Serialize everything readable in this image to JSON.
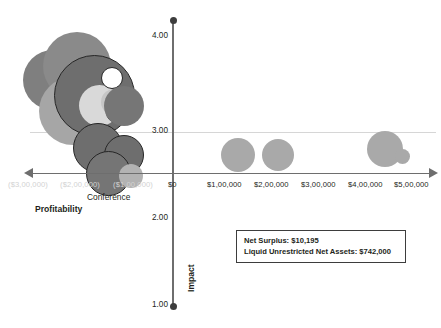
{
  "chart_data": {
    "type": "scatter",
    "title": "",
    "xlabel": "Profitability",
    "ylabel": "Impact",
    "xlim": [
      -350000,
      550000
    ],
    "ylim": [
      1.0,
      4.3
    ],
    "grid": true,
    "legend_position": "none",
    "x_tick_labels": [
      "($3,00,000)",
      "($2,00,000)",
      "($1,00,000)",
      "$0",
      "$1,00,000",
      "$2,00,000",
      "$3,00,000",
      "$4,00,000",
      "$5,00,000"
    ],
    "x_tick_values": [
      -300000,
      -200000,
      -100000,
      0,
      100000,
      200000,
      300000,
      400000,
      500000
    ],
    "y_tick_labels": [
      "4.00",
      "3.00",
      "2.00",
      "1.00"
    ],
    "y_tick_values": [
      4.0,
      3.0,
      2.0,
      1.0
    ],
    "annotations": [
      {
        "text": "Conference",
        "x": -215000,
        "y": 1.82
      },
      {
        "text": "Profitability",
        "x": -295000,
        "y": 1.68
      }
    ],
    "series": [
      {
        "name": "Programs",
        "points": [
          {
            "x": -258000,
            "y": 3.6,
            "size": 60,
            "color": "#7f7f7f",
            "outline": "none"
          },
          {
            "x": -205000,
            "y": 3.76,
            "size": 68,
            "color": "#8a8a8a",
            "outline": "none"
          },
          {
            "x": -214000,
            "y": 3.24,
            "size": 68,
            "color": "#a6a6a6",
            "outline": "none"
          },
          {
            "x": -168000,
            "y": 3.42,
            "size": 81,
            "color": "#6e6e6e",
            "outline": "#262626"
          },
          {
            "x": -158000,
            "y": 3.3,
            "size": 41,
            "color": "#d9d9d9",
            "outline": "none"
          },
          {
            "x": -130000,
            "y": 3.62,
            "size": 22,
            "color": "#ffffff",
            "outline": "#262626"
          },
          {
            "x": -126000,
            "y": 3.34,
            "size": 26,
            "color": "#c6c6c6",
            "outline": "none"
          },
          {
            "x": -120000,
            "y": 3.22,
            "size": 21,
            "color": "#ffffff",
            "outline": "#262626"
          },
          {
            "x": -104000,
            "y": 3.3,
            "size": 40,
            "color": "#767676",
            "outline": "none"
          },
          {
            "x": -160000,
            "y": 2.82,
            "size": 50,
            "color": "#6e6e6e",
            "outline": "#262626"
          },
          {
            "x": -104000,
            "y": 2.74,
            "size": 40,
            "color": "#6e6e6e",
            "outline": "#262626"
          },
          {
            "x": -138000,
            "y": 2.52,
            "size": 45,
            "color": "#757575",
            "outline": "#262626"
          },
          {
            "x": -90000,
            "y": 2.5,
            "size": 24,
            "color": "#b3b3b3",
            "outline": "none"
          },
          {
            "x": 140000,
            "y": 2.74,
            "size": 34,
            "color": "#a9a9a9",
            "outline": "none"
          },
          {
            "x": 225000,
            "y": 2.74,
            "size": 32,
            "color": "#a9a9a9",
            "outline": "none"
          },
          {
            "x": 455000,
            "y": 2.8,
            "size": 36,
            "color": "#a9a9a9",
            "outline": "none"
          },
          {
            "x": 492000,
            "y": 2.72,
            "size": 15,
            "color": "#a9a9a9",
            "outline": "none"
          }
        ]
      }
    ]
  },
  "info_box": {
    "line1": "Net Surplus: $10,195",
    "line2": "Liquid Unrestricted Net Assets: $742,000"
  },
  "colors": {
    "axis": "#6e6e6e",
    "tick_text": "#231f20",
    "negative_tick_text": "#d2d2d2",
    "gridline": "#cfcfcf",
    "box_border": "#3d3d3d"
  }
}
